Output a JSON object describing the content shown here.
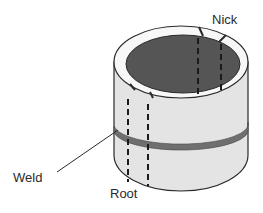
{
  "diagram": {
    "labels": {
      "nick": "Nick",
      "weld": "Weld",
      "root": "Root"
    },
    "colors": {
      "pipe_wall": "#e4e4e4",
      "pipe_rim": "#f7f7f7",
      "pipe_interior": "#555555",
      "weld_band": "#6f6f6f",
      "outline": "#2a2a2a",
      "background": "#ffffff"
    },
    "cut_lines": [
      {
        "name": "root-cut-pair",
        "position": "front-left"
      },
      {
        "name": "nick-cut-pair",
        "position": "back-right"
      }
    ]
  }
}
